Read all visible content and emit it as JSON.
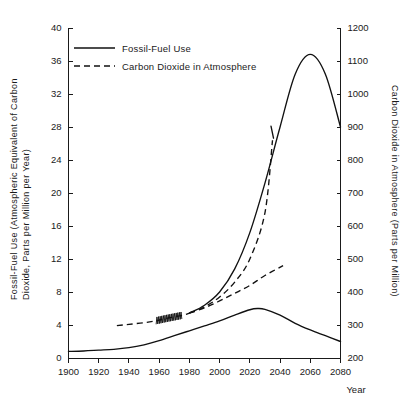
{
  "chart_data": {
    "type": "line",
    "title": "",
    "xlabel": "Year",
    "ylabel": "Fossil-Fuel Use (Atmospheric Equivalent of Carbon Dioxide, Parts per Million per Year)",
    "ylabel_line1": "Fossil-Fuel Use (Atmospheric Equivalent of Carbon",
    "ylabel_line2": "Dioxide, Parts per Million per Year)",
    "y2label": "Carbon Dioxide in Atmosphere (Parts per Million)",
    "xlim": [
      1900,
      2080
    ],
    "ylim": [
      0,
      40
    ],
    "y2lim": [
      200,
      1200
    ],
    "grid": false,
    "legend_position": "top-left",
    "xticks": [
      1900,
      1920,
      1940,
      1960,
      1980,
      2000,
      2020,
      2040,
      2060,
      2080
    ],
    "xtick_labels": [
      "1900",
      "1920",
      "1940",
      "1960",
      "1980",
      "2000",
      "2020",
      "2040",
      "2060",
      "2080"
    ],
    "yticks": [
      0,
      4,
      8,
      12,
      16,
      20,
      24,
      28,
      32,
      36,
      40
    ],
    "ytick_labels": [
      "0",
      "4",
      "8",
      "12",
      "16",
      "20",
      "24",
      "28",
      "32",
      "36",
      "40"
    ],
    "y2ticks": [
      200,
      300,
      400,
      500,
      600,
      700,
      800,
      900,
      1000,
      1100,
      1200
    ],
    "y2tick_labels": [
      "200",
      "300",
      "400",
      "500",
      "600",
      "700",
      "800",
      "900",
      "1000",
      "1100",
      "1200"
    ],
    "series": [
      {
        "name": "Fossil-Fuel Use",
        "style": "solid",
        "axis": "left",
        "x": [
          1900,
          1910,
          1920,
          1930,
          1940,
          1950,
          1960,
          1970,
          1980,
          1990,
          2000,
          2010,
          2020,
          2025,
          2030,
          2040,
          2050,
          2060,
          2070,
          2080
        ],
        "values": [
          0.8,
          0.85,
          0.95,
          1.05,
          1.25,
          1.6,
          2.1,
          2.7,
          3.3,
          3.9,
          4.5,
          5.2,
          5.85,
          6.0,
          5.9,
          5.2,
          4.2,
          3.4,
          2.7,
          2.0
        ]
      },
      {
        "name": "Carbon Dioxide in Atmosphere",
        "style": "dashed",
        "axis": "right",
        "note": "measured record 1958-1975 drawn as seasonal sawtooth; projection bifurcates after 1980 into a high and a low branch",
        "x": [
          1932,
          1940,
          1950,
          1958,
          1965,
          1975,
          1980,
          1990,
          2000,
          2010,
          2020,
          2030,
          2035
        ],
        "values": [
          298,
          302,
          307,
          313,
          320,
          329,
          336,
          355,
          385,
          430,
          500,
          640,
          860
        ]
      },
      {
        "name": "Carbon Dioxide in Atmosphere (low branch)",
        "style": "dashed",
        "axis": "right",
        "x": [
          1980,
          1990,
          2000,
          2010,
          2020,
          2030,
          2042
        ],
        "values": [
          336,
          352,
          373,
          396,
          420,
          450,
          480
        ]
      },
      {
        "name": "Carbon Dioxide in Atmosphere (continuation to peak, solid)",
        "style": "solid",
        "axis": "right",
        "x": [
          1980,
          1990,
          2000,
          2010,
          2020,
          2030,
          2040,
          2050,
          2060,
          2070,
          2080
        ],
        "values": [
          336,
          360,
          400,
          470,
          580,
          730,
          900,
          1060,
          1120,
          1060,
          900
        ]
      }
    ],
    "legend": [
      {
        "label": "Fossil-Fuel Use",
        "style": "solid"
      },
      {
        "label": "Carbon Dioxide in Atmosphere",
        "style": "dashed"
      }
    ],
    "annotations": [
      {
        "kind": "sawtooth",
        "label": "seasonal oscillation of measured CO2",
        "x_start": 1958,
        "x_end": 1975
      },
      {
        "kind": "tick-whisker",
        "label": "short vertical stroke on steep CO2 branch",
        "x": 2035
      }
    ],
    "colors": {
      "line": "#111111",
      "axis": "#1a1a1a",
      "background": "#ffffff"
    }
  }
}
